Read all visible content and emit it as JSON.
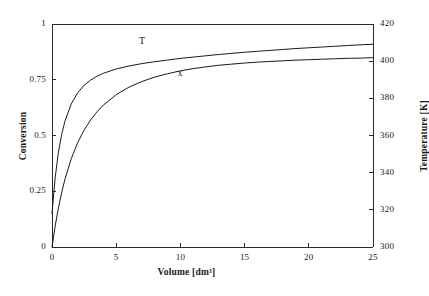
{
  "chart_data": {
    "type": "line",
    "title": "",
    "xlabel": "Volume [dm³]",
    "ylabel": "Conversion",
    "y2label": "Temperature [K]",
    "xlim": [
      0,
      25
    ],
    "ylim": [
      0,
      1
    ],
    "y2lim": [
      300,
      420
    ],
    "grid": false,
    "legend_position": "inline-annotations",
    "xticks": [
      "0",
      "5",
      "10",
      "15",
      "20",
      "25"
    ],
    "xtick_values": [
      0,
      5,
      10,
      15,
      20,
      25
    ],
    "yticks": [
      "0",
      "0.25",
      "0.5",
      "0.75",
      "1"
    ],
    "ytick_values": [
      0,
      0.25,
      0.5,
      0.75,
      1
    ],
    "y2ticks": [
      "300",
      "320",
      "340",
      "360",
      "380",
      "400",
      "420"
    ],
    "y2tick_values": [
      300,
      320,
      340,
      360,
      380,
      400,
      420
    ],
    "x": [
      0,
      0.25,
      0.5,
      0.75,
      1,
      1.5,
      2,
      2.5,
      3,
      3.5,
      4,
      5,
      6,
      7,
      8,
      9,
      10,
      11,
      12,
      13,
      14,
      15,
      16,
      17,
      18,
      19,
      20,
      21,
      22,
      23,
      24,
      25
    ],
    "series": [
      {
        "name": "T",
        "label": "T",
        "axis": "right",
        "color": "#1a1a1a",
        "annotation_x": 7.0,
        "annotation_y": 406.5,
        "values": [
          318.0,
          337.5,
          351.0,
          360.5,
          367.5,
          377.0,
          383.0,
          387.0,
          389.8,
          391.9,
          393.5,
          395.8,
          397.4,
          398.7,
          399.7,
          400.6,
          401.5,
          402.2,
          402.9,
          403.6,
          404.2,
          404.8,
          405.3,
          405.8,
          406.3,
          406.8,
          407.2,
          407.6,
          408.0,
          408.4,
          408.8,
          409.1
        ]
      },
      {
        "name": "x",
        "label": "x",
        "axis": "left",
        "color": "#1a1a1a",
        "annotation_x": 10.0,
        "annotation_y": 0.745,
        "values": [
          0.0,
          0.095,
          0.175,
          0.243,
          0.302,
          0.396,
          0.468,
          0.524,
          0.569,
          0.606,
          0.636,
          0.683,
          0.717,
          0.742,
          0.762,
          0.777,
          0.79,
          0.8,
          0.808,
          0.815,
          0.82,
          0.825,
          0.829,
          0.832,
          0.835,
          0.838,
          0.84,
          0.842,
          0.844,
          0.846,
          0.847,
          0.849
        ]
      }
    ]
  },
  "plot_frame": {
    "left": 52,
    "right": 373,
    "top": 24,
    "bottom": 247
  }
}
